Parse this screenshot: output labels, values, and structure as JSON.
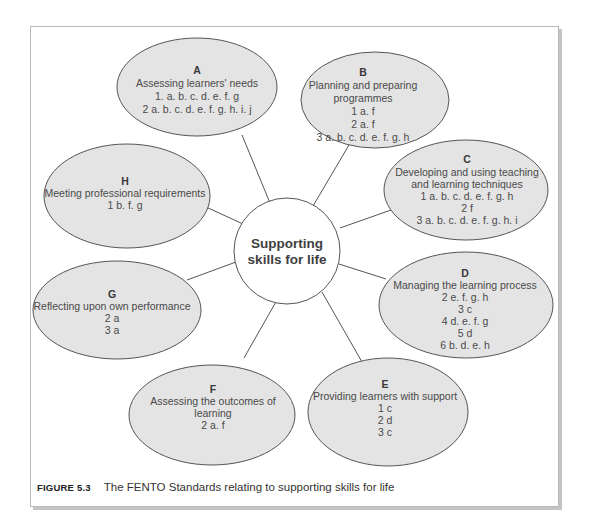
{
  "figure": {
    "center": {
      "lines": [
        "Supporting",
        "skills for life"
      ]
    },
    "nodes": [
      {
        "id": "A",
        "letter": "A",
        "lines": [
          "Assessing learners' needs",
          "1. a. b. c. d. e. f. g",
          "2 a. b. c. d. e. f. g. h. i. j"
        ]
      },
      {
        "id": "B",
        "letter": "B",
        "lines": [
          "Planning and preparing",
          "programmes",
          "1 a. f",
          "2 a. f",
          "3 a. b. c. d. e. f. g. h"
        ]
      },
      {
        "id": "C",
        "letter": "C",
        "lines": [
          "Developing and using teaching",
          "and learning techniques",
          "1 a. b. c. d. e. f. g. h",
          "2 f",
          "3 a. b. c. d. e. f. g. h. i"
        ]
      },
      {
        "id": "D",
        "letter": "D",
        "lines": [
          "Managing the learning process",
          "2 e. f. g. h",
          "3 c",
          "4 d. e. f. g",
          "5 d",
          "6 b. d. e. h"
        ]
      },
      {
        "id": "E",
        "letter": "E",
        "lines": [
          "Providing learners with support",
          "1 c",
          "2 d",
          "3 c"
        ]
      },
      {
        "id": "F",
        "letter": "F",
        "lines": [
          "Assessing the outcomes of",
          "learning",
          "2 a. f"
        ]
      },
      {
        "id": "G",
        "letter": "G",
        "lines": [
          "Reflecting upon own performance",
          "2 a",
          "3 a"
        ]
      },
      {
        "id": "H",
        "letter": "H",
        "lines": [
          "Meeting professional requirements",
          "1 b. f. g"
        ]
      }
    ],
    "colors": {
      "node_fill": "#e4e4e4",
      "node_stroke": "#555555",
      "center_fill": "#ffffff",
      "text": "#4a4a4a"
    }
  },
  "caption": {
    "label": "FIGURE 5.3",
    "text": "The FENTO Standards relating to supporting skills for life"
  }
}
